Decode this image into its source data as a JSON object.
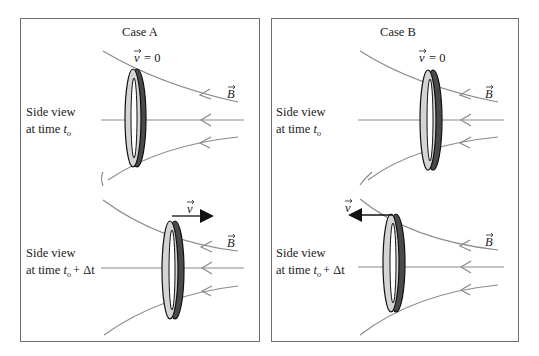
{
  "panels": [
    {
      "title": "Case A",
      "top": {
        "label_line1": "Side view",
        "label_line2_prefix": "at time ",
        "label_time": "t",
        "label_sub": "o",
        "velocity_label": "v",
        "velocity_value": "= 0",
        "field_label": "B"
      },
      "bottom": {
        "label_line1": "Side view",
        "label_line2_prefix": "at time ",
        "label_time": "t",
        "label_sub": "o",
        "label_suffix": "+ Δt",
        "velocity_label": "v",
        "velocity_direction": "right",
        "field_label": "B"
      }
    },
    {
      "title": "Case B",
      "top": {
        "label_line1": "Side view",
        "label_line2_prefix": "at time ",
        "label_time": "t",
        "label_sub": "o",
        "velocity_label": "v",
        "velocity_value": "= 0",
        "field_label": "B"
      },
      "bottom": {
        "label_line1": "Side view",
        "label_line2_prefix": "at time ",
        "label_time": "t",
        "label_sub": "o",
        "label_suffix": "+ Δt",
        "velocity_label": "v",
        "velocity_direction": "left",
        "field_label": "B"
      }
    }
  ],
  "colors": {
    "field_line": "#8a8a8a",
    "ring_front": "#d4d4d4",
    "ring_back": "#4a4a4a",
    "border": "#6e6e6e"
  }
}
